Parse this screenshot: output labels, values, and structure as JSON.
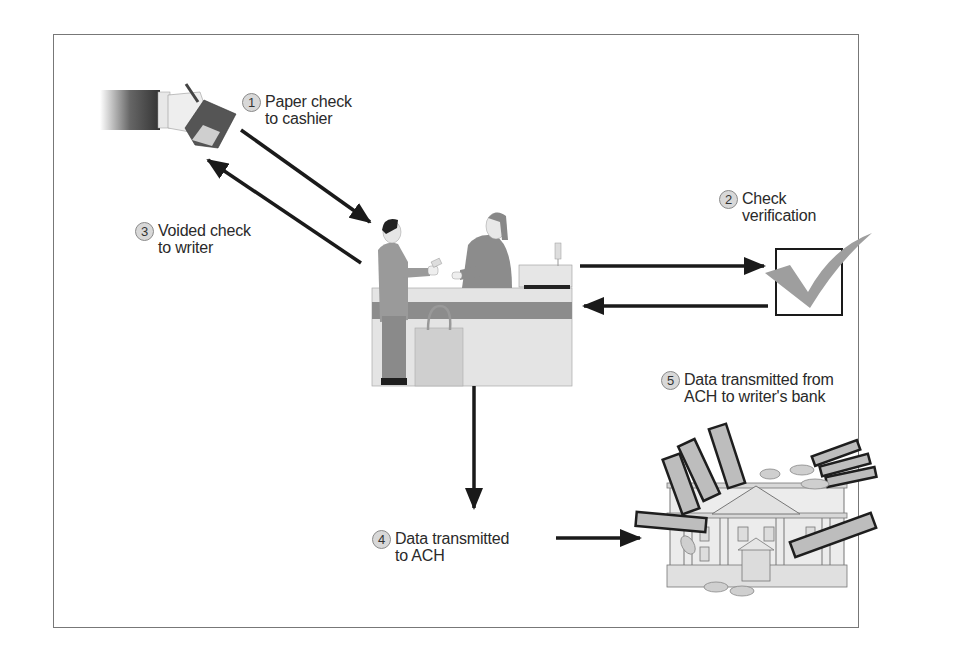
{
  "diagram": {
    "type": "process-flow",
    "steps": [
      {
        "number": "1",
        "lines": [
          "Paper check",
          "to cashier"
        ]
      },
      {
        "number": "2",
        "lines": [
          "Check",
          "verification"
        ]
      },
      {
        "number": "3",
        "lines": [
          "Voided check",
          "to writer"
        ]
      },
      {
        "number": "4",
        "lines": [
          "Data transmitted",
          "to ACH"
        ]
      },
      {
        "number": "5",
        "lines": [
          "Data transmitted from",
          "ACH to writer's bank"
        ]
      }
    ],
    "nodes": [
      {
        "id": "check-writer",
        "icon": "hand-with-checkbook-icon"
      },
      {
        "id": "cashier-counter",
        "icon": "cashier-counter-icon"
      },
      {
        "id": "verification",
        "icon": "checkmark-box-icon"
      },
      {
        "id": "writers-bank",
        "icon": "bank-with-money-icon"
      }
    ],
    "edges": [
      {
        "from": "check-writer",
        "to": "cashier-counter",
        "step": "1"
      },
      {
        "from": "cashier-counter",
        "to": "verification",
        "step": "2"
      },
      {
        "from": "verification",
        "to": "cashier-counter",
        "step": "2"
      },
      {
        "from": "cashier-counter",
        "to": "check-writer",
        "step": "3"
      },
      {
        "from": "cashier-counter",
        "to": "ach",
        "step": "4"
      },
      {
        "from": "ach",
        "to": "writers-bank",
        "step": "5"
      }
    ],
    "colors": {
      "frame": "#777777",
      "arrow": "#1a1a1a",
      "badge_fill": "#d8d8d8",
      "checkmark": "#9a9a9a",
      "counter_stripe": "#8c8c8c"
    }
  }
}
